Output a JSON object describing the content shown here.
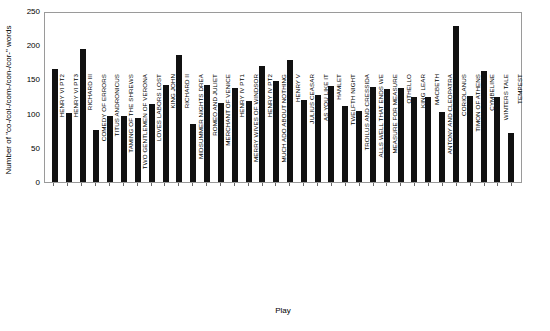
{
  "chart_data": {
    "type": "bar",
    "title": "",
    "xlabel": "Play",
    "ylabel": "Number of \"co-/col-/com-/con-/cor-\" words",
    "ylim": [
      0,
      250
    ],
    "yticks": [
      0,
      50,
      100,
      150,
      200,
      250
    ],
    "grid": false,
    "legend": null,
    "bar_color": "#111111",
    "categories": [
      "HENRY VI PT2",
      "HENRY VI PT3",
      "RICHARD III",
      "COMEDY OF ERRORS",
      "TITUS ANDRONICUS",
      "TAMING OF THE SHREWS",
      "TWO GENTLEMEN OF VERONA",
      "LOVES LABORS LOST",
      "KING JOHN",
      "RICHARD II",
      "MIDSUMMER NIGHTS DREA",
      "ROMEO AND JULIET",
      "MERCHANT OF VENICE",
      "HENRY IV PT1",
      "MERRY WIVES OF WINDSOR",
      "HENRY IV PT2",
      "MUCH ADO ABOUT NOTHING",
      "HENRY V",
      "JULIUS CEASAR",
      "AS YOU LIKE IT",
      "HAMLET",
      "TWELFTH NIGHT",
      "TROILUS AND CRESSIDA",
      "ALLS WELL THAT ENDS WE",
      "MEASURE FOR MEASURE",
      "OTHELLO",
      "KING LEAR",
      "MACBETH",
      "ANTONY AND CLEOPATRA",
      "CORIOLANUS",
      "TIMON OF ATHENS",
      "CYMBELINE",
      "WINTERS TALE",
      "TEMPEST"
    ],
    "values": [
      165,
      101,
      194,
      76,
      97,
      97,
      94,
      114,
      142,
      185,
      85,
      142,
      116,
      137,
      118,
      170,
      148,
      179,
      120,
      127,
      140,
      111,
      104,
      139,
      136,
      138,
      124,
      124,
      103,
      228,
      126,
      163,
      124,
      72
    ]
  }
}
